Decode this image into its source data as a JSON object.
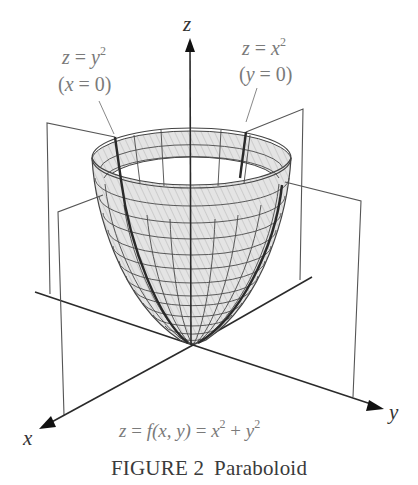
{
  "figure": {
    "caption_label": "FIGURE 2",
    "caption_title": "Paraboloid",
    "equation": {
      "lhs": "z",
      "middle": "f(x, y)",
      "rhs_x": "x",
      "rhs_y": "y",
      "exp": "2",
      "text": "z = f(x, y) = x² + y²"
    },
    "axes": {
      "x_label": "x",
      "y_label": "y",
      "z_label": "z"
    },
    "annotations": [
      {
        "line1_var": "z",
        "line1_rhs": "y",
        "exp": "2",
        "condition_var": "x",
        "condition_val": "0",
        "text": "z = y² (x = 0)"
      },
      {
        "line1_var": "z",
        "line1_rhs": "x",
        "exp": "2",
        "condition_var": "y",
        "condition_val": "0",
        "text": "z = x² (y = 0)"
      }
    ],
    "colors": {
      "axis": "#2a2a2a",
      "plane": "#555555",
      "mesh": "#444444",
      "surface_fill": "#dcdcdc",
      "label_gray": "#7a7a7a",
      "caption": "#3a3a3a"
    }
  }
}
